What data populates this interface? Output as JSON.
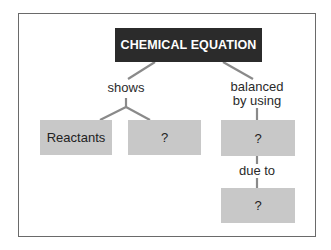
{
  "diagram": {
    "title": "CHEMICAL EQUATION",
    "links": {
      "left": "shows",
      "right_line1": "balanced",
      "right_line2": "by using",
      "bottom": "due to"
    },
    "nodes": {
      "reactants": "Reactants",
      "unknown_left": "?",
      "unknown_right": "?",
      "unknown_bottom": "?"
    },
    "colors": {
      "title_bg": "#2b2b2b",
      "title_text": "#ffffff",
      "node_bg": "#c8c8c8",
      "line": "#8a8a8a",
      "frame": "#6a6a6a"
    }
  }
}
